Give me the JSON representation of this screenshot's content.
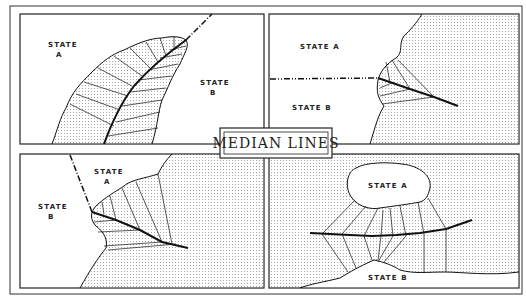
{
  "title": "MEDIAN LINES",
  "colors": {
    "ink": "#1a1a1a",
    "paper": "#ffffff",
    "stipple": "#9a9a9a"
  },
  "panels": [
    {
      "id": "top-left",
      "labels": [
        {
          "text": "STATE",
          "sub": "A"
        },
        {
          "text": "STATE",
          "sub": "B"
        }
      ],
      "description": "Narrow bay between two states with median line bisecting it, dash-dot boundary continuing to sea"
    },
    {
      "id": "top-right",
      "labels": [
        {
          "text": "STATE A"
        },
        {
          "text": "STATE B"
        }
      ],
      "description": "Land boundary (dash-dot) meets coast; median line extends seaward"
    },
    {
      "id": "bottom-left",
      "labels": [
        {
          "text": "STATE",
          "sub": "A"
        },
        {
          "text": "STATE",
          "sub": "B"
        }
      ],
      "description": "Diagonal land boundary reaching coast; median line extends into sea"
    },
    {
      "id": "bottom-right",
      "labels": [
        {
          "text": "STATE A"
        },
        {
          "text": "STATE B"
        }
      ],
      "description": "Island state A opposite coastal state B with median line between them"
    }
  ]
}
